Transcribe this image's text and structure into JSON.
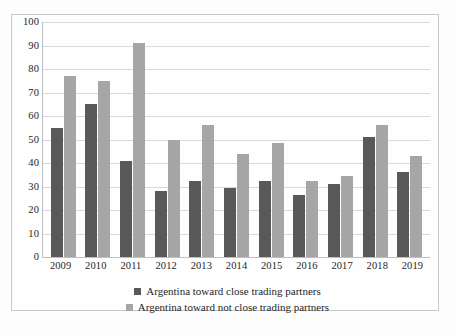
{
  "chart_data": {
    "type": "bar",
    "title": "",
    "subtitle": "",
    "xlabel": "",
    "ylabel": "",
    "ylim": [
      0,
      100
    ],
    "yticks": [
      0,
      10,
      20,
      30,
      40,
      50,
      60,
      70,
      80,
      90,
      100
    ],
    "grid": true,
    "legend_position": "bottom",
    "categories": [
      "2009",
      "2010",
      "2011",
      "2012",
      "2013",
      "2014",
      "2015",
      "2016",
      "2017",
      "2018",
      "2019"
    ],
    "series": [
      {
        "name": "Argentina toward close trading partners",
        "color": "#595959",
        "values": [
          55,
          65,
          41,
          28,
          32.5,
          29.5,
          32.5,
          26.5,
          31,
          51,
          36
        ]
      },
      {
        "name": "Argentina toward not close trading partners",
        "color": "#a6a6a6",
        "values": [
          77,
          75,
          91,
          50,
          56,
          44,
          48.5,
          32.5,
          34.5,
          56,
          43
        ]
      }
    ]
  }
}
